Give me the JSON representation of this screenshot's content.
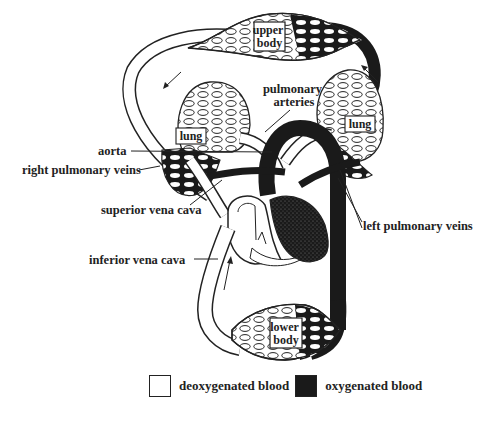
{
  "figure": {
    "colors": {
      "deoxygenated": "#ffffff",
      "oxygenated": "#1a1a1a",
      "outline": "#222222"
    },
    "boxed_labels": {
      "upper_body": [
        "upper",
        "body"
      ],
      "lower_body": [
        "lower",
        "body"
      ],
      "lung_left_side": "lung",
      "lung_right_side": "lung"
    },
    "callouts": {
      "pulmonary_arteries": [
        "pulmonary",
        "arteries"
      ],
      "aorta": "aorta",
      "right_pulmonary_veins": "right pulmonary veins",
      "superior_vena_cava": "superior vena cava",
      "left_pulmonary_veins": "left pulmonary veins",
      "inferior_vena_cava": "inferior vena cava"
    }
  },
  "legend": {
    "items": [
      {
        "label": "deoxygenated blood",
        "color": "#ffffff"
      },
      {
        "label": "oxygenated blood",
        "color": "#1a1a1a"
      }
    ]
  }
}
